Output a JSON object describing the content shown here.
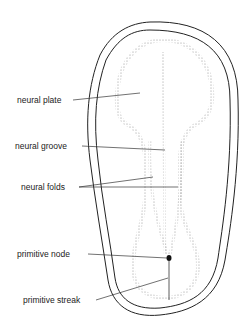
{
  "diagram": {
    "labels": [
      {
        "text": "neural plate",
        "x": 17,
        "y": 95
      },
      {
        "text": "neural groove",
        "x": 15,
        "y": 141
      },
      {
        "text": "neural folds",
        "x": 21,
        "y": 182
      },
      {
        "text": "primitive node",
        "x": 17,
        "y": 252
      },
      {
        "text": "primitive streak",
        "x": 23,
        "y": 295
      }
    ]
  }
}
